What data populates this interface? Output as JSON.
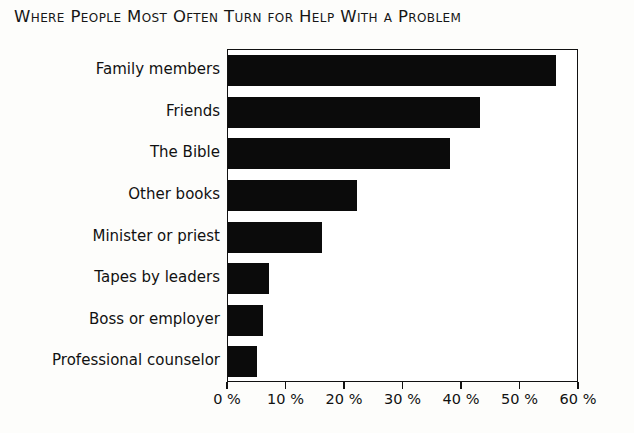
{
  "chart_data": {
    "type": "bar",
    "orientation": "horizontal",
    "title": "Where People Most Often Turn for Help With a Problem",
    "xlabel": "",
    "ylabel": "",
    "xlim": [
      0,
      60
    ],
    "grid": false,
    "legend": null,
    "bar_color": "#0b0b0b",
    "categories": [
      "Family members",
      "Friends",
      "The Bible",
      "Other books",
      "Minister or priest",
      "Tapes by leaders",
      "Boss or employer",
      "Professional counselor"
    ],
    "values": [
      56,
      43,
      38,
      22,
      16,
      7,
      6,
      5
    ],
    "xticks": [
      0,
      10,
      20,
      30,
      40,
      50,
      60
    ],
    "xtick_labels": [
      "0 %",
      "10 %",
      "20 %",
      "30 %",
      "40 %",
      "50 %",
      "60 %"
    ]
  },
  "chart": {
    "title": "Where People Most Often Turn for Help With a Problem",
    "axis_unit": "%"
  }
}
